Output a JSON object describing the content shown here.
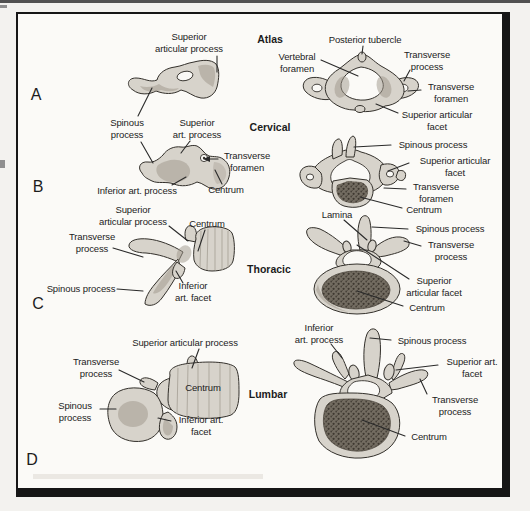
{
  "panel_letters": [
    "A",
    "B",
    "C",
    "D"
  ],
  "section_headers": [
    "Atlas",
    "Cervical",
    "Thoracic",
    "Lumbar"
  ],
  "labels": [
    {
      "text": "Superior\narticular process"
    },
    {
      "text": "Spinous\nprocess"
    },
    {
      "text": "Superior\nart. process"
    },
    {
      "text": "Transverse\nforamen"
    },
    {
      "text": "Inferior art. process"
    },
    {
      "text": "Centrum"
    },
    {
      "text": "Posterior tubercle"
    },
    {
      "text": "Vertebral\nforamen"
    },
    {
      "text": "Transverse\nprocess"
    },
    {
      "text": "Transverse\nforamen"
    },
    {
      "text": "Superior articular\nfacet"
    },
    {
      "text": "Spinous process"
    },
    {
      "text": "Superior articular\nfacet"
    },
    {
      "text": "Transverse\nforamen"
    },
    {
      "text": "Centrum"
    },
    {
      "text": "Superior\narticular process"
    },
    {
      "text": "Centrum"
    },
    {
      "text": "Transverse\nprocess"
    },
    {
      "text": "Spinous process"
    },
    {
      "text": "Inferior\nart. facet"
    },
    {
      "text": "Lamina"
    },
    {
      "text": "Spinous process"
    },
    {
      "text": "Transverse\nprocess"
    },
    {
      "text": "Superior\narticular facet"
    },
    {
      "text": "Centrum"
    },
    {
      "text": "Superior articular process"
    },
    {
      "text": "Transverse\nprocess"
    },
    {
      "text": "Centrum"
    },
    {
      "text": "Spinous\nprocess"
    },
    {
      "text": "Inferior art.\nfacet"
    },
    {
      "text": "Inferior\nart. process"
    },
    {
      "text": "Spinous process"
    },
    {
      "text": "Superior art.\nfacet"
    },
    {
      "text": "Transverse\nprocess"
    },
    {
      "text": "Centrum"
    }
  ],
  "colors": {
    "paper_outside": "#f3f2ef",
    "paper": "#fbfaf7",
    "frame": "#161616",
    "ink": "#1c1c1c",
    "leader": "#2a2a2a",
    "bone": "#d7d3cb",
    "outline": "#33302b",
    "shade": "#9d968a",
    "hole": "#faf9f6",
    "cut_surface": "#736c61",
    "cut_dots": "#423d35"
  }
}
